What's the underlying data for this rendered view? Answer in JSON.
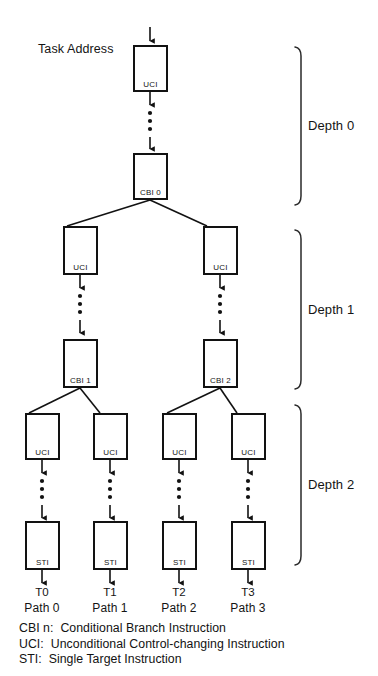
{
  "figure": {
    "kind": "task-execution-path-tree",
    "entry_label": "Task Address",
    "background_color": "#ffffff",
    "ink_color": "#121212"
  },
  "nodes": {
    "root_uci": {
      "label": "UCI"
    },
    "root_cbi": {
      "label": "CBI 0"
    },
    "d1_uci_left": {
      "label": "UCI"
    },
    "d1_uci_right": {
      "label": "UCI"
    },
    "d1_cbi_left": {
      "label": "CBI 1"
    },
    "d1_cbi_right": {
      "label": "CBI 2"
    },
    "d2_uci_0": {
      "label": "UCI"
    },
    "d2_uci_1": {
      "label": "UCI"
    },
    "d2_uci_2": {
      "label": "UCI"
    },
    "d2_uci_3": {
      "label": "UCI"
    },
    "d2_sti_0": {
      "label": "STI"
    },
    "d2_sti_1": {
      "label": "STI"
    },
    "d2_sti_2": {
      "label": "STI"
    },
    "d2_sti_3": {
      "label": "STI"
    }
  },
  "depth_brackets": [
    {
      "label": "Depth 0"
    },
    {
      "label": "Depth 1"
    },
    {
      "label": "Depth 2"
    }
  ],
  "terminals": [
    {
      "target": "T0",
      "path": "Path 0"
    },
    {
      "target": "T1",
      "path": "Path 1"
    },
    {
      "target": "T2",
      "path": "Path 2"
    },
    {
      "target": "T3",
      "path": "Path 3"
    }
  ],
  "legend": [
    "CBI n:  Conditional Branch Instruction",
    "UCI:  Unconditional Control-changing Instruction",
    "STI:  Single Target Instruction"
  ]
}
